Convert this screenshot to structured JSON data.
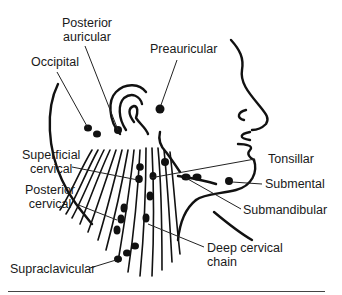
{
  "diagram": {
    "colors": {
      "ink": "#111111",
      "text": "#1a1a1a",
      "background": "#ffffff"
    },
    "labels": {
      "posterior_auricular": [
        "Posterior",
        "auricular"
      ],
      "preauricular": "Preauricular",
      "occipital": "Occipital",
      "superficial_cervical": [
        "Superficial",
        "cervical"
      ],
      "tonsillar": "Tonsillar",
      "submental": "Submental",
      "posterior_cervical": [
        "Posterior",
        "cervical"
      ],
      "submandibular": "Submandibular",
      "deep_cervical_chain": [
        "Deep cervical",
        "chain"
      ],
      "supraclavicular": "Supraclavicular"
    }
  }
}
